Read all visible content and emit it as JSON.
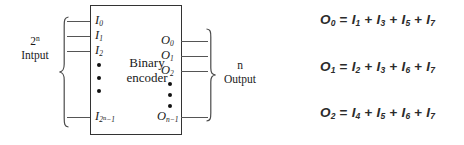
{
  "diagram": {
    "block": {
      "title_line1": "Binary",
      "title_line2": "encoder"
    },
    "input_group": {
      "count_label_base": "2",
      "count_label_exponent": "n",
      "word": "Intput",
      "brace": "left-curly-brace"
    },
    "output_group": {
      "count_label": "n",
      "word": "Output",
      "brace": "right-curly-brace"
    },
    "input_pins": [
      {
        "symbol": "I",
        "sub": "0"
      },
      {
        "symbol": "I",
        "sub": "1"
      },
      {
        "symbol": "I",
        "sub": "2"
      },
      {
        "symbol": "I",
        "sub": "2",
        "sub_sup": "n",
        "sub_tail": "−1"
      }
    ],
    "output_pins": [
      {
        "symbol": "O",
        "sub": "0"
      },
      {
        "symbol": "O",
        "sub": "1"
      },
      {
        "symbol": "O",
        "sub": "2"
      },
      {
        "symbol": "O",
        "sub": "n−1"
      }
    ],
    "ellipsis_dots": 3
  },
  "equations": [
    {
      "lhs": "O",
      "lhs_sub": "0",
      "eq": "=",
      "terms": [
        {
          "symbol": "I",
          "sub": "1"
        },
        {
          "symbol": "I",
          "sub": "3"
        },
        {
          "symbol": "I",
          "sub": "5"
        },
        {
          "symbol": "I",
          "sub": "7"
        }
      ],
      "plus": "+"
    },
    {
      "lhs": "O",
      "lhs_sub": "1",
      "eq": "=",
      "terms": [
        {
          "symbol": "I",
          "sub": "2"
        },
        {
          "symbol": "I",
          "sub": "3"
        },
        {
          "symbol": "I",
          "sub": "6"
        },
        {
          "symbol": "I",
          "sub": "7"
        }
      ],
      "plus": "+"
    },
    {
      "lhs": "O",
      "lhs_sub": "2",
      "eq": "=",
      "terms": [
        {
          "symbol": "I",
          "sub": "4"
        },
        {
          "symbol": "I",
          "sub": "5"
        },
        {
          "symbol": "I",
          "sub": "6"
        },
        {
          "symbol": "I",
          "sub": "7"
        }
      ],
      "plus": "+"
    }
  ],
  "colors": {
    "ink": "#1a1a1a",
    "wire": "#555555",
    "equation_ink": "#2b2b2b",
    "background": "#ffffff"
  }
}
